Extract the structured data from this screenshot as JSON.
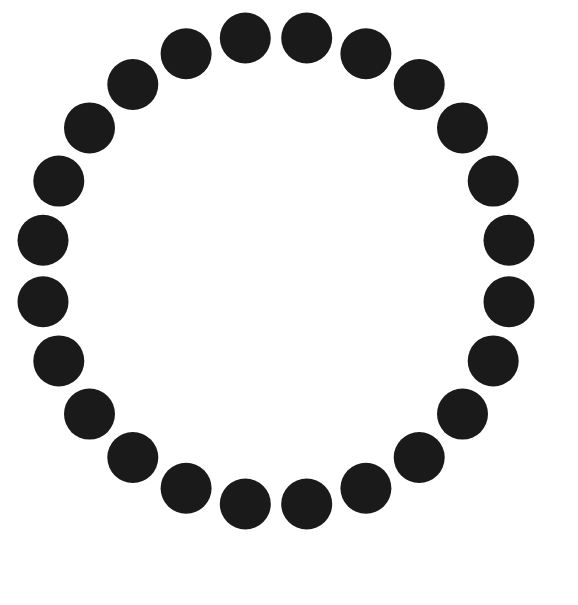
{
  "canvas": {
    "width": 578,
    "height": 605,
    "background_color": "#ffffff",
    "title": "Ring of Dots"
  },
  "shape_data": {
    "type": "scatter",
    "description": "Twenty-four solid filled circles of equal size evenly spaced around the circumference of a single large circle, forming an open ring on a plain white background.",
    "marker": {
      "shape": "circle",
      "fill_color": "#1a1a1a",
      "stroke": "none",
      "diameter": 51,
      "radius": 25.5
    },
    "ring": {
      "center_x": 276,
      "center_y": 271,
      "radius": 235,
      "count": 24,
      "angular_step_degrees": 15,
      "start_angle_degrees": -97.5
    },
    "dots": [
      {
        "index": 1,
        "angle": -97.5,
        "cx": 245.3,
        "cy": 38.0
      },
      {
        "index": 2,
        "angle": -82.5,
        "cx": 306.7,
        "cy": 38.0
      },
      {
        "index": 3,
        "angle": -67.5,
        "cx": 365.9,
        "cy": 53.8
      },
      {
        "index": 4,
        "angle": -52.5,
        "cx": 419.2,
        "cy": 84.5
      },
      {
        "index": 5,
        "angle": -37.5,
        "cx": 462.5,
        "cy": 127.9
      },
      {
        "index": 6,
        "angle": -22.5,
        "cx": 493.2,
        "cy": 181.1
      },
      {
        "index": 7,
        "angle": -7.5,
        "cx": 509.0,
        "cy": 240.3
      },
      {
        "index": 8,
        "angle": 7.5,
        "cx": 509.0,
        "cy": 301.7
      },
      {
        "index": 9,
        "angle": 22.5,
        "cx": 493.2,
        "cy": 360.9
      },
      {
        "index": 10,
        "angle": 37.5,
        "cx": 462.5,
        "cy": 414.1
      },
      {
        "index": 11,
        "angle": 52.5,
        "cx": 419.2,
        "cy": 457.5
      },
      {
        "index": 12,
        "angle": 67.5,
        "cx": 365.9,
        "cy": 488.2
      },
      {
        "index": 13,
        "angle": 82.5,
        "cx": 306.7,
        "cy": 504.0
      },
      {
        "index": 14,
        "angle": 97.5,
        "cx": 245.3,
        "cy": 504.0
      },
      {
        "index": 15,
        "angle": 112.5,
        "cx": 186.1,
        "cy": 488.2
      },
      {
        "index": 16,
        "angle": 127.5,
        "cx": 132.8,
        "cy": 457.5
      },
      {
        "index": 17,
        "angle": 142.5,
        "cx": 89.5,
        "cy": 414.1
      },
      {
        "index": 18,
        "angle": 157.5,
        "cx": 58.8,
        "cy": 360.9
      },
      {
        "index": 19,
        "angle": 172.5,
        "cx": 43.0,
        "cy": 301.7
      },
      {
        "index": 20,
        "angle": 187.5,
        "cx": 43.0,
        "cy": 240.3
      },
      {
        "index": 21,
        "angle": 202.5,
        "cx": 58.8,
        "cy": 181.1
      },
      {
        "index": 22,
        "angle": 217.5,
        "cx": 89.5,
        "cy": 127.9
      },
      {
        "index": 23,
        "angle": 232.5,
        "cx": 132.8,
        "cy": 84.5
      },
      {
        "index": 24,
        "angle": 247.5,
        "cx": 186.1,
        "cy": 53.8
      }
    ]
  }
}
